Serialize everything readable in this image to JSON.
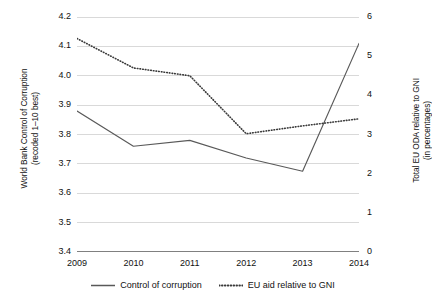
{
  "chart_data": {
    "type": "line",
    "title": "",
    "xlabel": "",
    "categories": [
      "2009",
      "2010",
      "2011",
      "2012",
      "2013",
      "2014"
    ],
    "x": [
      2009,
      2010,
      2011,
      2012,
      2013,
      2014
    ],
    "grid": true,
    "legend_position": "bottom",
    "axes": {
      "left": {
        "label_line1": "World Bank Control of Corruption",
        "label_line2": "(recoded 1–10 best)",
        "ylim": [
          3.4,
          4.2
        ],
        "ticks": [
          "3.4",
          "3.5",
          "3.6",
          "3.7",
          "3.8",
          "3.9",
          "4.0",
          "4.1",
          "4.2"
        ],
        "tick_values": [
          3.4,
          3.5,
          3.6,
          3.7,
          3.8,
          3.9,
          4.0,
          4.1,
          4.2
        ]
      },
      "right": {
        "label_line1": "Total EU ODA relative to GNI",
        "label_line2": "(in percentages)",
        "ylim": [
          0,
          6
        ],
        "ticks": [
          "0",
          "1",
          "2",
          "3",
          "4",
          "5",
          "6"
        ],
        "tick_values": [
          0,
          1,
          2,
          3,
          4,
          5,
          6
        ]
      }
    },
    "series": [
      {
        "name": "Control of corruption",
        "axis": "left",
        "style": "solid",
        "color": "#595959",
        "values": [
          3.88,
          3.76,
          3.78,
          3.72,
          3.675,
          4.11
        ]
      },
      {
        "name": "EU aid relative to GNI",
        "axis": "right",
        "style": "dotted",
        "color": "#3a3a3a",
        "values": [
          5.45,
          4.7,
          4.5,
          3.02,
          3.22,
          3.4
        ]
      }
    ],
    "legend": [
      {
        "label": "Control of corruption",
        "style": "solid"
      },
      {
        "label": "EU aid relative to GNI",
        "style": "dotted"
      }
    ]
  },
  "colors": {
    "gridline": "#d9d9d9",
    "axis": "#808080",
    "series_solid": "#595959",
    "series_dotted": "#3a3a3a",
    "text": "#111111",
    "background": "#ffffff"
  }
}
